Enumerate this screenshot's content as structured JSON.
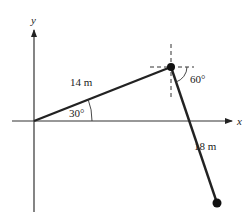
{
  "diagram": {
    "type": "displacement-vector-diagram",
    "axes": {
      "x_label": "x",
      "y_label": "y"
    },
    "vectors": [
      {
        "label": "14 m",
        "magnitude_m": 14,
        "angle_label": "30°",
        "angle_reference": "above +x axis"
      },
      {
        "label": "18 m",
        "magnitude_m": 18,
        "angle_label": "60°",
        "angle_reference": "below horizontal at junction"
      }
    ],
    "colors": {
      "line": "#222222",
      "dashed": "#333333",
      "background": "#ffffff"
    }
  }
}
